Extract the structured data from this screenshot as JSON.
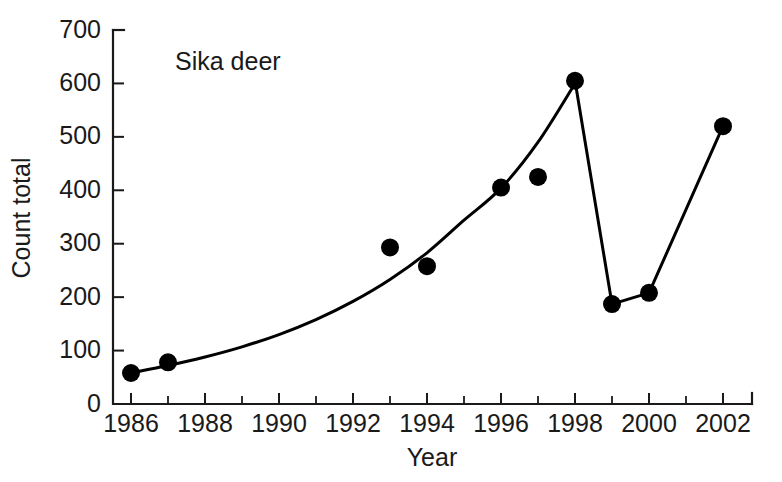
{
  "chart_data": {
    "type": "line",
    "title": "",
    "annotation": "Sika deer",
    "xlabel": "Year",
    "ylabel": "Count total",
    "xlim": [
      1986,
      2002
    ],
    "ylim": [
      0,
      700
    ],
    "grid": false,
    "legend": "none",
    "y_ticks": [
      0,
      100,
      200,
      300,
      400,
      500,
      600,
      700
    ],
    "y_tick_labels": [
      "0",
      "100",
      "200",
      "300",
      "400",
      "500",
      "600",
      "700"
    ],
    "x_ticks": [
      1986,
      1988,
      1990,
      1992,
      1994,
      1996,
      1998,
      2000,
      2002
    ],
    "x_tick_labels": [
      "1986",
      "1988",
      "1990",
      "1992",
      "1994",
      "1996",
      "1998",
      "2000",
      "2002"
    ],
    "x_minor_ticks": [
      1987,
      1989,
      1991,
      1993,
      1995,
      1997,
      1999,
      2001
    ],
    "series": [
      {
        "name": "Sika deer count total",
        "marker": "filled-circle",
        "color": "#000000",
        "x": [
          1986,
          1987,
          1993,
          1994,
          1996,
          1997,
          1998,
          1999,
          2000,
          2002
        ],
        "values": [
          58,
          78,
          293,
          258,
          405,
          425,
          605,
          187,
          208,
          520
        ]
      }
    ],
    "fitted_curve": {
      "name": "exponential trend then observed trajectory",
      "description": "smooth exponential rise 1986-1998 followed by straight segments 1998-1999-2000-2002",
      "x": [
        1986,
        1987,
        1988,
        1989,
        1990,
        1991,
        1992,
        1993,
        1994,
        1995,
        1996,
        1997,
        1998,
        1999,
        2000,
        2002
      ],
      "values": [
        58,
        72,
        88,
        107,
        130,
        158,
        192,
        233,
        283,
        344,
        404,
        490,
        600,
        187,
        208,
        520
      ]
    }
  },
  "axes": {
    "y_title": "Count total",
    "x_title": "Year"
  },
  "annotations": {
    "species_label": "Sika deer"
  },
  "colors": {
    "line": "#000000",
    "marker": "#000000",
    "axis": "#1a1a1a",
    "background": "#ffffff"
  }
}
